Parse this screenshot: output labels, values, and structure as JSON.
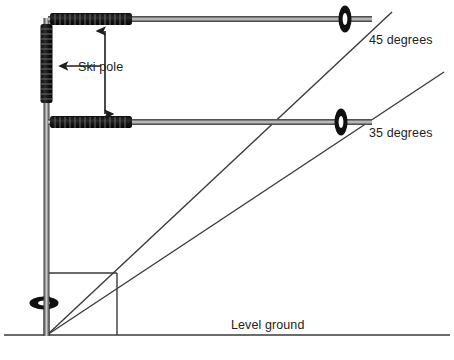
{
  "diagram": {
    "labels": {
      "upper_angle": "45 degrees",
      "lower_angle": "35 degrees",
      "ground": "Level ground",
      "ski_pole": "Ski pole"
    },
    "colors": {
      "ink": "#222222",
      "line": "#3a3a3a",
      "grip_dark": "#1a1a1a",
      "shaft_dark": "#4a4a4a",
      "shaft_light": "#c9c9c9",
      "background": "#ffffff"
    },
    "geometry": {
      "vertex": {
        "x": 47,
        "y": 335
      },
      "ground_line": {
        "x1": 4,
        "y1": 335,
        "x2": 450,
        "y2": 335
      },
      "square": {
        "x": 47,
        "y": 273,
        "width": 70,
        "height": 62
      },
      "angle_line_45": {
        "x1": 47,
        "y1": 335,
        "x2": 392,
        "y2": 12
      },
      "angle_line_35": {
        "x1": 47,
        "y1": 335,
        "x2": 444,
        "y2": 72
      },
      "vertical_pole": {
        "x": 47,
        "y_top": 18,
        "y_bottom": 336
      },
      "upper_pole": {
        "y": 19,
        "x_left": 48,
        "x_right": 372
      },
      "lower_pole": {
        "y": 122,
        "x_left": 48,
        "x_right": 372
      },
      "baskets": [
        {
          "name": "upper-pole-basket",
          "cx": 345,
          "cy": 19,
          "rx": 6,
          "ry": 13
        },
        {
          "name": "lower-pole-basket",
          "cx": 341,
          "cy": 122,
          "rx": 6,
          "ry": 13
        },
        {
          "name": "vertical-pole-basket",
          "cx": 44,
          "cy": 303,
          "rx": 14,
          "ry": 6
        }
      ],
      "measure_arrow": {
        "x": 105,
        "y_top": 30,
        "y_bottom": 115
      },
      "pointer_arrow": {
        "x_from": 101,
        "x_to": 64,
        "y": 66
      }
    }
  }
}
